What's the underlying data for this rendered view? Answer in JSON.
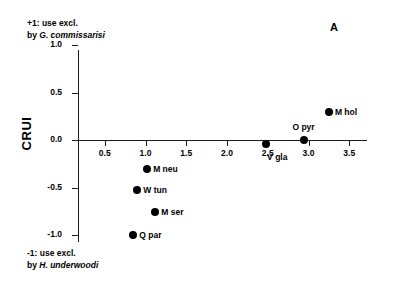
{
  "chart_data": {
    "type": "scatter",
    "title": "",
    "panel_label": "A",
    "xlabel": "",
    "ylabel": "CRUI",
    "xlim": [
      0.0,
      3.55
    ],
    "ylim": [
      -1.0,
      1.0
    ],
    "grid": false,
    "legend": "none",
    "xticks": [
      "0.5",
      "1.0",
      "1.5",
      "2.0",
      "2.5",
      "3.0",
      "3.5"
    ],
    "xtick_values": [
      0.5,
      1.0,
      1.5,
      2.0,
      2.5,
      3.0,
      3.5
    ],
    "yticks": [
      "1.0",
      "0.5",
      "0.0",
      "-0.5",
      "-1.0"
    ],
    "ytick_values": [
      1.0,
      0.5,
      0.0,
      -0.5,
      -1.0
    ],
    "points": [
      {
        "label": "M hol",
        "x": 3.25,
        "y": 0.3,
        "label_pos": "right"
      },
      {
        "label": "O pyr",
        "x": 2.95,
        "y": 0.0,
        "label_pos": "above"
      },
      {
        "label": "V gla",
        "x": 2.48,
        "y": -0.04,
        "label_pos": "below-right"
      },
      {
        "label": "M neu",
        "x": 1.02,
        "y": -0.31,
        "label_pos": "right"
      },
      {
        "label": "W tun",
        "x": 0.9,
        "y": -0.53,
        "label_pos": "right"
      },
      {
        "label": "M ser",
        "x": 1.12,
        "y": -0.76,
        "label_pos": "right"
      },
      {
        "label": "Q par",
        "x": 0.85,
        "y": -1.0,
        "label_pos": "right"
      }
    ],
    "annotations": [
      {
        "position": "top-left",
        "line1": "+1: use excl.",
        "line2_prefix": "by ",
        "line2_species": "G. commissarisi"
      },
      {
        "position": "bottom-left",
        "line1": "-1: use excl.",
        "line2_prefix": "by ",
        "line2_species": "H. underwoodi"
      }
    ]
  },
  "axis": {
    "y_title": "CRUI"
  },
  "panel": {
    "label": "A"
  },
  "annotation_top": {
    "line1": "+1: use excl.",
    "prefix": "by ",
    "species": "G. commissarisi"
  },
  "annotation_bottom": {
    "line1": "-1: use excl.",
    "prefix": "by ",
    "species": "H. underwoodi"
  }
}
